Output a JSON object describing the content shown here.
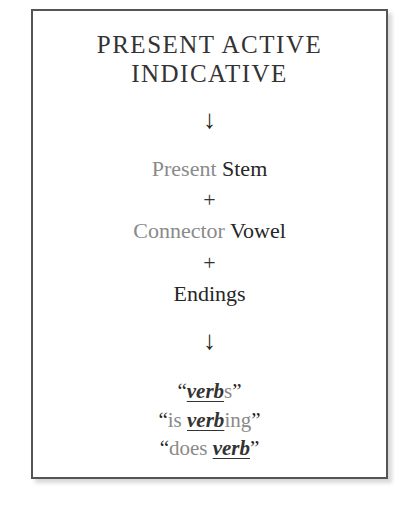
{
  "diagram": {
    "title_line1": "PRESENT ACTIVE",
    "title_line2": "INDICATIVE",
    "arrow1": "↓",
    "components": [
      {
        "light": "Present",
        "dark": "Stem"
      },
      {
        "light": "Connector",
        "dark": "Vowel"
      },
      {
        "light": "",
        "dark": "Endings"
      }
    ],
    "plus": "+",
    "arrow2": "↓",
    "translations": [
      {
        "open": "“",
        "pre": "",
        "verb": "verb",
        "post": "s",
        "close": "”"
      },
      {
        "open": "“",
        "pre": "is ",
        "verb": "verb",
        "post": "ing",
        "close": "”"
      },
      {
        "open": "“",
        "pre": "does ",
        "verb": "verb",
        "post": "",
        "close": "”"
      }
    ],
    "colors": {
      "border": "#555555",
      "light_text": "#8a8a8a",
      "dark_text": "#262626"
    }
  }
}
